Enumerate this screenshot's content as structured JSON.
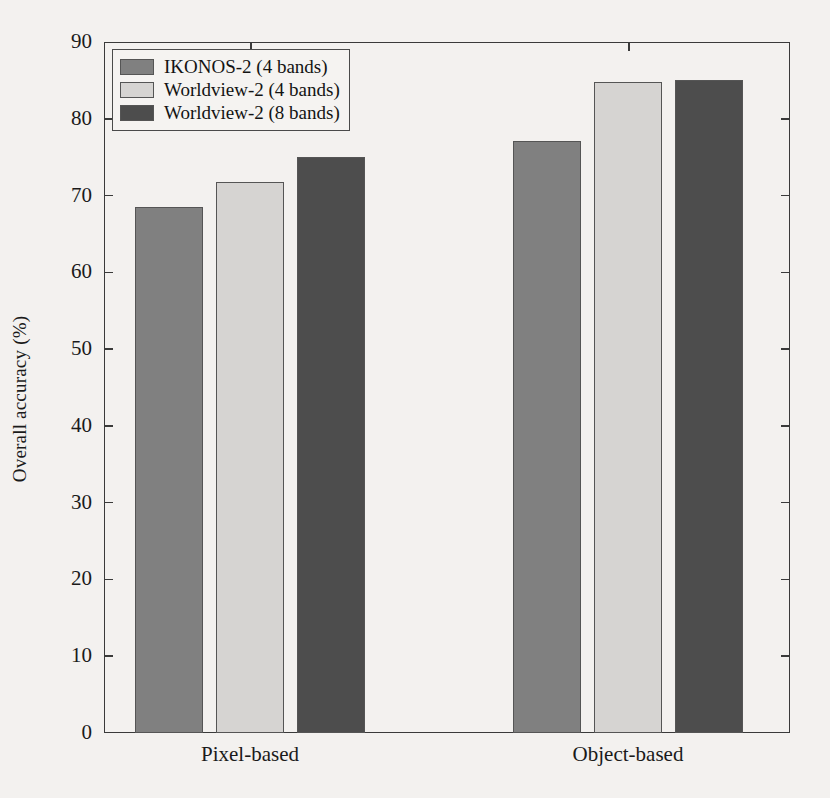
{
  "chart_data": {
    "type": "bar",
    "title": "",
    "xlabel": "",
    "ylabel": "Overall accuracy (%)",
    "categories": [
      "Pixel-based",
      "Object-based"
    ],
    "series": [
      {
        "name": "IKONOS-2 (4 bands)",
        "values": [
          68.5,
          77.1
        ],
        "color": "#808080"
      },
      {
        "name": "Worldview-2 (4 bands)",
        "values": [
          71.8,
          84.8
        ],
        "color": "#d6d4d2"
      },
      {
        "name": "Worldview-2 (8 bands)",
        "values": [
          75.0,
          85.1
        ],
        "color": "#4d4d4d"
      }
    ],
    "ylim": [
      0,
      90
    ],
    "yticks": [
      0,
      10,
      20,
      30,
      40,
      50,
      60,
      70,
      80,
      90
    ],
    "ytick_labels": [
      "0",
      "10",
      "20",
      "30",
      "40",
      "50",
      "60",
      "70",
      "80",
      "90"
    ],
    "grid": false,
    "legend_position": "upper left",
    "frame": "box",
    "background_color": "#f3f1ef"
  },
  "legend": {
    "entries": [
      {
        "label": "IKONOS-2 (4 bands)",
        "color": "#808080"
      },
      {
        "label": "Worldview-2 (4 bands)",
        "color": "#d6d4d2"
      },
      {
        "label": "Worldview-2 (8 bands)",
        "color": "#4d4d4d"
      }
    ]
  }
}
